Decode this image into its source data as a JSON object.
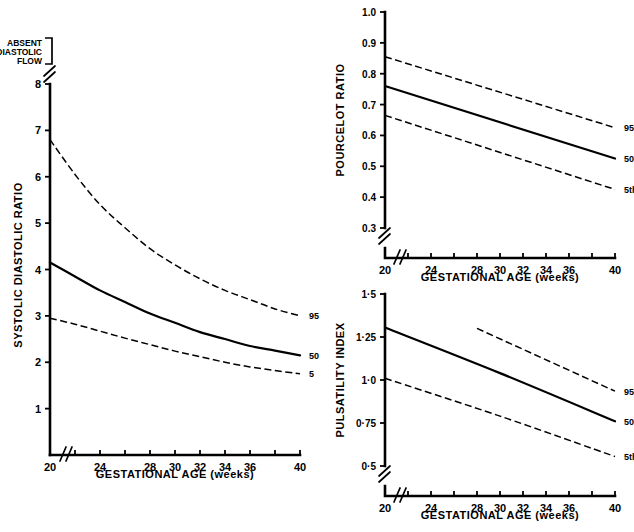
{
  "figure": {
    "background": "#ffffff",
    "ink": "#000000",
    "panel_count": 3
  },
  "chart_data": [
    {
      "id": "systolic-diastolic-ratio",
      "type": "line",
      "title": "",
      "xlabel": "GESTATIONAL AGE (weeks)",
      "ylabel": "SYSTOLIC DIASTOLIC RATIO",
      "xlim": [
        20,
        40
      ],
      "ylim": [
        0,
        8
      ],
      "grid": false,
      "axis_break_x": true,
      "axis_break_y": true,
      "legend_position": "right-of-curve-ends",
      "xticks": [
        20,
        22,
        24,
        26,
        28,
        30,
        32,
        34,
        36,
        38,
        40
      ],
      "xtick_labels": [
        "20",
        "",
        "24",
        "",
        "28",
        "30",
        "32",
        "34",
        "36",
        "",
        "40"
      ],
      "yticks": [
        1,
        2,
        3,
        4,
        5,
        6,
        7,
        8
      ],
      "ytick_labels": [
        "1",
        "2",
        "3",
        "4",
        "5",
        "6",
        "7",
        "8"
      ],
      "annotations": [
        {
          "text": "ABSENT\nDIASTOLIC\nFLOW",
          "lines": [
            "ABSENT",
            "DIASTOLIC",
            "FLOW"
          ],
          "position": "above-y-axis-break"
        }
      ],
      "series": [
        {
          "name": "95",
          "label": "95",
          "style": "dashed",
          "x": [
            20,
            22,
            24,
            26,
            28,
            30,
            32,
            34,
            36,
            38,
            40
          ],
          "values": [
            6.8,
            6.05,
            5.4,
            4.9,
            4.45,
            4.1,
            3.8,
            3.55,
            3.35,
            3.15,
            3.0
          ]
        },
        {
          "name": "50",
          "label": "50",
          "style": "solid",
          "x": [
            20,
            22,
            24,
            26,
            28,
            30,
            32,
            34,
            36,
            38,
            40
          ],
          "values": [
            4.15,
            3.85,
            3.55,
            3.3,
            3.05,
            2.85,
            2.65,
            2.5,
            2.35,
            2.25,
            2.15
          ]
        },
        {
          "name": "5",
          "label": "5",
          "style": "dashed",
          "x": [
            20,
            22,
            24,
            26,
            28,
            30,
            32,
            34,
            36,
            38,
            40
          ],
          "values": [
            2.95,
            2.82,
            2.67,
            2.52,
            2.38,
            2.24,
            2.12,
            2.0,
            1.9,
            1.82,
            1.75
          ]
        }
      ]
    },
    {
      "id": "pourcelot-ratio",
      "type": "line",
      "title": "",
      "xlabel": "GESTATIONAL AGE (weeks)",
      "ylabel": "POURCELOT RATIO",
      "xlim": [
        20,
        40
      ],
      "ylim": [
        0.3,
        1.0
      ],
      "grid": false,
      "axis_break_x": true,
      "axis_break_y": true,
      "legend_position": "right-of-curve-ends",
      "xticks": [
        20,
        22,
        24,
        26,
        28,
        30,
        32,
        34,
        36,
        38,
        40
      ],
      "xtick_labels": [
        "20",
        "",
        "24",
        "",
        "28",
        "30",
        "32",
        "34",
        "36",
        "",
        "40"
      ],
      "yticks": [
        0.3,
        0.4,
        0.5,
        0.6,
        0.7,
        0.8,
        0.9,
        1.0
      ],
      "ytick_labels": [
        "0.3",
        "0.4",
        "0.5",
        "0.6",
        "0.7",
        "0.8",
        "0.9",
        "1.0"
      ],
      "annotations": [],
      "series": [
        {
          "name": "95th",
          "label": "95th",
          "style": "dashed",
          "x": [
            20,
            40
          ],
          "values": [
            0.855,
            0.625
          ]
        },
        {
          "name": "50th",
          "label": "50th",
          "style": "solid",
          "x": [
            20,
            40
          ],
          "values": [
            0.76,
            0.525
          ]
        },
        {
          "name": "5th",
          "label": "5th",
          "style": "dashed",
          "x": [
            20,
            40
          ],
          "values": [
            0.665,
            0.425
          ]
        }
      ]
    },
    {
      "id": "pulsatility-index",
      "type": "line",
      "title": "",
      "xlabel": "GESTATIONAL AGE (weeks)",
      "ylabel": "PULSATILITY INDEX",
      "xlim": [
        20,
        40
      ],
      "ylim": [
        0.5,
        1.5
      ],
      "grid": false,
      "axis_break_x": true,
      "axis_break_y": true,
      "legend_position": "right-of-curve-ends",
      "xticks": [
        20,
        22,
        24,
        26,
        28,
        30,
        32,
        34,
        36,
        38,
        40
      ],
      "xtick_labels": [
        "20",
        "",
        "24",
        "",
        "28",
        "30",
        "32",
        "34",
        "36",
        "",
        "40"
      ],
      "yticks": [
        0.5,
        0.75,
        1.0,
        1.25,
        1.5
      ],
      "ytick_labels": [
        "0·5",
        "0·75",
        "1·0",
        "1·25",
        "1·5"
      ],
      "annotations": [],
      "series": [
        {
          "name": "95th",
          "label": "95th",
          "style": "dashed",
          "x": [
            28,
            40
          ],
          "values": [
            1.3,
            0.935
          ]
        },
        {
          "name": "50th",
          "label": "50th",
          "style": "solid",
          "x": [
            20,
            30,
            40
          ],
          "values": [
            1.305,
            1.04,
            0.76
          ]
        },
        {
          "name": "5th",
          "label": "5th",
          "style": "dashed",
          "x": [
            20,
            30,
            40
          ],
          "values": [
            1.01,
            0.79,
            0.555
          ]
        }
      ]
    }
  ]
}
